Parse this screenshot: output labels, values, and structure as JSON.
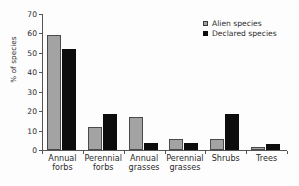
{
  "chart_data": {
    "type": "bar",
    "title": "",
    "subtitle": "",
    "xlabel": "",
    "ylabel": "% of species",
    "ylim": [
      0,
      70
    ],
    "ytick_values": [
      0,
      10,
      20,
      30,
      40,
      50,
      60,
      70
    ],
    "ytick_labels": [
      "0",
      "10",
      "20",
      "30",
      "40",
      "50",
      "60",
      "70"
    ],
    "grid": false,
    "legend_position": "top-right",
    "categories": [
      "Annual\nforbs",
      "Perennial\nforbs",
      "Annual\ngrasses",
      "Perennial\ngrasses",
      "Shrubs",
      "Trees"
    ],
    "series": [
      {
        "name": "Alien species",
        "color": "#a3a3a3",
        "values": [
          59,
          12,
          17,
          5.5,
          5.5,
          1.5
        ]
      },
      {
        "name": "Declared species",
        "color": "#0d0d0d",
        "values": [
          52,
          18.5,
          3.5,
          3.5,
          18.5,
          3.3
        ]
      }
    ]
  },
  "legend": {
    "items": [
      {
        "label": "Alien species",
        "swatch": "alien-swatch"
      },
      {
        "label": "Declared species",
        "swatch": "declared-swatch"
      }
    ]
  }
}
